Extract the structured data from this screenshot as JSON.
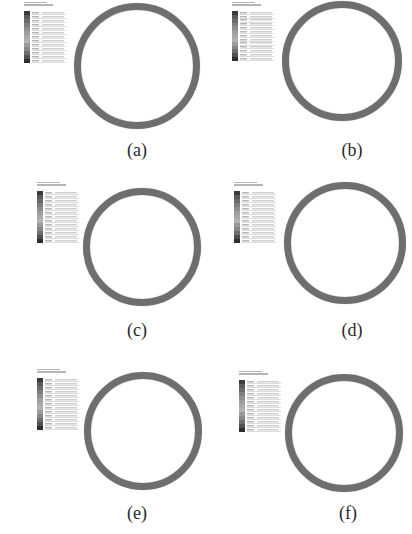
{
  "figure": {
    "panels": [
      {
        "id": "a",
        "label": "(a)",
        "ring": {
          "cx": 137,
          "cy": 66,
          "r": 63,
          "thickness": 7
        },
        "legend": {
          "x": 24,
          "y": 1,
          "h": 62
        },
        "caption": {
          "x": 137,
          "y": 140
        }
      },
      {
        "id": "b",
        "label": "(b)",
        "ring": {
          "cx": 342,
          "cy": 61,
          "r": 60,
          "thickness": 7
        },
        "legend": {
          "x": 232,
          "y": 1,
          "h": 60
        },
        "caption": {
          "x": 352,
          "y": 140
        }
      },
      {
        "id": "c",
        "label": "(c)",
        "ring": {
          "cx": 142,
          "cy": 247,
          "r": 59,
          "thickness": 7
        },
        "legend": {
          "x": 37,
          "y": 181,
          "h": 62
        },
        "caption": {
          "x": 137,
          "y": 320
        }
      },
      {
        "id": "d",
        "label": "(d)",
        "ring": {
          "cx": 345,
          "cy": 243,
          "r": 61,
          "thickness": 7
        },
        "legend": {
          "x": 234,
          "y": 181,
          "h": 62
        },
        "caption": {
          "x": 352,
          "y": 320
        }
      },
      {
        "id": "e",
        "label": "(e)",
        "ring": {
          "cx": 143,
          "cy": 431,
          "r": 59,
          "thickness": 7
        },
        "legend": {
          "x": 37,
          "y": 368,
          "h": 62
        },
        "caption": {
          "x": 137,
          "y": 503
        }
      },
      {
        "id": "f",
        "label": "(f)",
        "ring": {
          "cx": 344,
          "cy": 433,
          "r": 59,
          "thickness": 7
        },
        "legend": {
          "x": 239,
          "y": 370,
          "h": 62
        },
        "caption": {
          "x": 348,
          "y": 503
        }
      }
    ],
    "legend_shades": [
      "#3a3a3a",
      "#5a5a5a",
      "#6a6a6a",
      "#7e7e7e",
      "#8e8e8e",
      "#9e9e9e",
      "#a8a8a8",
      "#b2b2b2",
      "#9a9a9a",
      "#888888",
      "#6e6e6e",
      "#505050",
      "#2e2e2e"
    ],
    "colors": {
      "ring": "#6e6e6e",
      "caption": "#2a2a2a",
      "background": "#ffffff"
    }
  }
}
